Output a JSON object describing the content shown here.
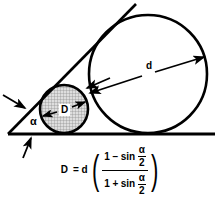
{
  "figure": {
    "background_color": "#ffffff",
    "stroke_color": "#000000",
    "hatch_fill_color": "#d9d9d9"
  },
  "labels": {
    "large_diameter": "d",
    "small_diameter": "D",
    "angle": "α"
  },
  "formula": {
    "lhs": "D",
    "equals": "=",
    "factor": "d",
    "open_paren": "(",
    "close_paren": ")",
    "numerator_one": "1",
    "numerator_op": "−",
    "numerator_fn": "sin",
    "denominator_one": "1",
    "denominator_op": "+",
    "denominator_fn": "sin",
    "angle_numerator": "α",
    "angle_denominator": "2",
    "plain_text": "D = d((1 − sin α/2) / (1 + sin α/2))"
  },
  "geometry": {
    "large_circle": {
      "cx": 148,
      "cy": 74,
      "r": 59,
      "fill": "#ffffff"
    },
    "small_circle": {
      "cx": 64,
      "cy": 109,
      "r": 24,
      "fill": "hatch"
    },
    "baseline": {
      "x1": 8,
      "y1": 134,
      "x2": 215,
      "y2": 134
    },
    "incline": {
      "x1": 8,
      "y1": 134,
      "x2": 136,
      "y2": 4
    },
    "diameter_arrow_large": {
      "x1": 89,
      "y1": 93,
      "x2": 205,
      "y2": 56
    },
    "diameter_arrow_small": {
      "x1": 42,
      "y1": 116,
      "x2": 86,
      "y2": 101
    },
    "pointer_to_incline": {
      "x1": 3,
      "y1": 95,
      "x2": 26,
      "y2": 109
    },
    "pointer_to_baseline": {
      "x1": 23,
      "y1": 157,
      "x2": 31,
      "y2": 137
    },
    "pointer_to_tangency": {
      "x1": 108,
      "y1": 79,
      "x2": 86,
      "y2": 88
    }
  }
}
